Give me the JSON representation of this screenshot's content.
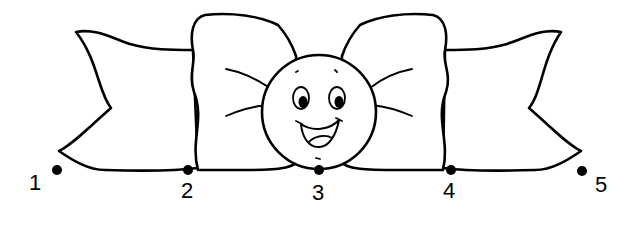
{
  "worksheet": {
    "subject": "bow tie with smiling face",
    "dots": [
      {
        "label": "1",
        "x": 57,
        "y": 170,
        "label_x": 30,
        "label_y": 172
      },
      {
        "label": "2",
        "x": 188,
        "y": 170,
        "label_x": 181,
        "label_y": 180
      },
      {
        "label": "3",
        "x": 319,
        "y": 170,
        "label_x": 312,
        "label_y": 182
      },
      {
        "label": "4",
        "x": 451,
        "y": 170,
        "label_x": 443,
        "label_y": 180
      },
      {
        "label": "5",
        "x": 582,
        "y": 171,
        "label_x": 595,
        "label_y": 174
      }
    ],
    "colors": {
      "line": "#000000",
      "background": "#ffffff"
    }
  }
}
